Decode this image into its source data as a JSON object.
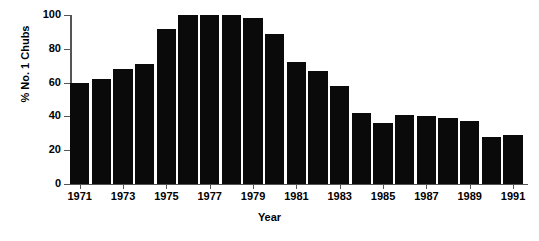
{
  "chart_data": {
    "type": "bar",
    "title": "",
    "xlabel": "Year",
    "ylabel": "% No. 1 Chubs",
    "categories": [
      "1971",
      "1972",
      "1973",
      "1974",
      "1975",
      "1976",
      "1977",
      "1978",
      "1979",
      "1980",
      "1981",
      "1982",
      "1983",
      "1984",
      "1985",
      "1986",
      "1987",
      "1988",
      "1989",
      "1990",
      "1991"
    ],
    "values": [
      60,
      62,
      68,
      71,
      92,
      100,
      100,
      100,
      98,
      89,
      72,
      67,
      58,
      42,
      36,
      41,
      40,
      39,
      37,
      28,
      29
    ],
    "ylim": [
      0,
      100
    ],
    "yticks": [
      0,
      20,
      40,
      60,
      80,
      100
    ],
    "ytick_labels": [
      "0",
      "20",
      "40",
      "60",
      "80",
      "100"
    ],
    "xtick_labels": [
      "1971",
      "1973",
      "1975",
      "1977",
      "1979",
      "1981",
      "1983",
      "1985",
      "1987",
      "1989",
      "1991"
    ],
    "grid": false,
    "legend": null,
    "bar_color": "#0a0a0a",
    "axis_color": "#555555",
    "background_color": "#ffffff"
  }
}
